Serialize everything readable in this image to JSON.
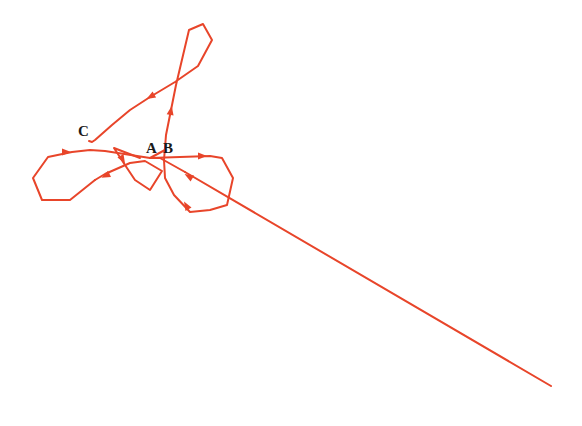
{
  "diagram": {
    "type": "trajectory",
    "line_color": "#e8452a",
    "labels": [
      {
        "id": "A",
        "text": "A",
        "x": 146,
        "y": 153
      },
      {
        "id": "B",
        "text": "B",
        "x": 163,
        "y": 153
      },
      {
        "id": "C",
        "text": "C",
        "x": 78,
        "y": 136
      }
    ],
    "segments": [
      {
        "name": "incoming-tail",
        "points": "551,386 185,172"
      },
      {
        "name": "right-lower-loop",
        "points": "185,172 160,158 150,158 165,150"
      },
      {
        "name": "left-small-loop",
        "points": "140,158 114,148 125,165 135,180 150,190 162,171 145,161 130,163 105,174 95,180"
      },
      {
        "name": "left-big-loop",
        "points": "95,180 70,200 42,200 33,178 48,157 72,152 90,150 105,151 150,158"
      },
      {
        "name": "right-loop",
        "points": "150,158 180,157 210,156 222,158 233,178 227,205 210,210 190,212 174,195 165,178 164,160"
      },
      {
        "name": "vertical-to-top",
        "points": "164,160 166,135 172,105 176,85 189,30 203,24 212,40 198,66 175,82 150,97 130,110 112,125 95,140 92,142 89,141"
      }
    ],
    "arrows": [
      {
        "x": 67,
        "y": 152,
        "angle": 0
      },
      {
        "x": 203,
        "y": 156,
        "angle": 0
      },
      {
        "x": 188,
        "y": 176,
        "angle": 210
      },
      {
        "x": 105,
        "y": 176,
        "angle": 155
      },
      {
        "x": 123,
        "y": 160,
        "angle": 60
      },
      {
        "x": 186,
        "y": 205,
        "angle": 240
      },
      {
        "x": 171,
        "y": 110,
        "angle": 280
      },
      {
        "x": 150,
        "y": 97,
        "angle": 150
      }
    ]
  }
}
